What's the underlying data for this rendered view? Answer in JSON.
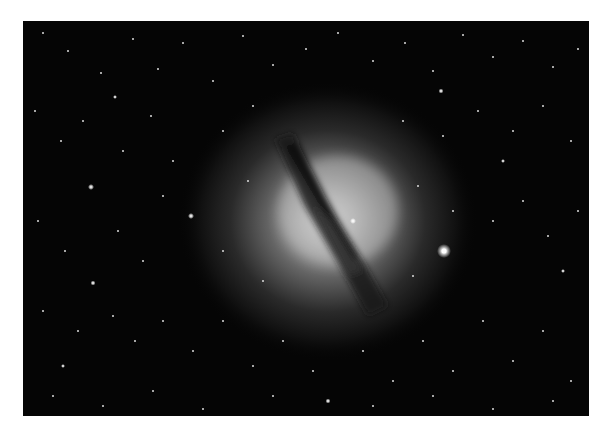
{
  "image": {
    "subject": "elliptical galaxy with dark dust lane in a star field",
    "style": "grayscale astrophotograph",
    "background_color": "#050505",
    "page_background": "#ffffff",
    "frame": {
      "left": 23,
      "top": 21,
      "width": 566,
      "height": 395
    },
    "galaxy": {
      "cx": 310,
      "cy": 198,
      "halo_rx": 120,
      "halo_ry": 110,
      "core_color": "#d8d8d8"
    },
    "dust_lane": {
      "from": [
        257,
        119
      ],
      "to": [
        352,
        282
      ]
    },
    "bright_star": {
      "x": 421,
      "y": 230
    }
  }
}
